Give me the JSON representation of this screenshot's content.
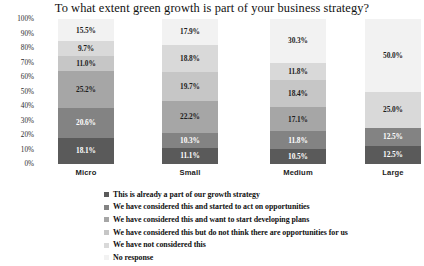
{
  "chart_data": {
    "type": "bar",
    "subtype": "100% stacked column",
    "title": "To what extent green growth is part of your business strategy?",
    "xlabel": "",
    "ylabel": "",
    "ylim": [
      0,
      100
    ],
    "yticks": [
      "0%",
      "10%",
      "20%",
      "30%",
      "40%",
      "50%",
      "60%",
      "70%",
      "80%",
      "90%",
      "100%"
    ],
    "grid": false,
    "legend_position": "bottom",
    "categories": [
      "Micro",
      "Small",
      "Medium",
      "Large"
    ],
    "series": [
      {
        "name": "No response",
        "color": "#f2f2f2",
        "text_on": "light",
        "values": [
          15.5,
          17.9,
          30.3,
          50.0
        ],
        "labels": [
          "15.5%",
          "17.9%",
          "30.3%",
          "50.0%"
        ]
      },
      {
        "name": "We have not considered this",
        "color": "#d9d9d9",
        "text_on": "light",
        "values": [
          9.7,
          18.8,
          11.8,
          25.0
        ],
        "labels": [
          "9.7%",
          "18.8%",
          "11.8%",
          "25.0%"
        ]
      },
      {
        "name": "We have considered this but do not think there are opportunities for us",
        "color": "#c6c6c6",
        "text_on": "light",
        "values": [
          11.0,
          19.7,
          18.4,
          0
        ],
        "labels": [
          "11.0%",
          "19.7%",
          "18.4%",
          ""
        ]
      },
      {
        "name": "We have considered this and want to start developing plans",
        "color": "#a6a6a6",
        "text_on": "light",
        "values": [
          25.2,
          22.2,
          17.1,
          0
        ],
        "labels": [
          "25.2%",
          "22.2%",
          "17.1%",
          ""
        ]
      },
      {
        "name": "We have considered this and started to act on opportunities",
        "color": "#838383",
        "text_on": "dark",
        "values": [
          20.6,
          10.3,
          11.8,
          12.5
        ],
        "labels": [
          "20.6%",
          "10.3%",
          "11.8%",
          "12.5%"
        ]
      },
      {
        "name": "This is already a part of our growth strategy",
        "color": "#5a5a5a",
        "text_on": "dark",
        "values": [
          18.1,
          11.1,
          10.5,
          12.5
        ],
        "labels": [
          "18.1%",
          "11.1%",
          "10.5%",
          "12.5%"
        ]
      }
    ],
    "legend_entries": [
      {
        "label": "This is already a part of our growth strategy",
        "color": "#5a5a5a"
      },
      {
        "label": "We have considered this and started to act on opportunities",
        "color": "#838383"
      },
      {
        "label": "We have considered this and want to start developing plans",
        "color": "#a6a6a6"
      },
      {
        "label": "We have considered this but do not think there are opportunities for us",
        "color": "#c6c6c6"
      },
      {
        "label": "We have not considered this",
        "color": "#d9d9d9"
      },
      {
        "label": "No response",
        "color": "#f2f2f2"
      }
    ]
  }
}
